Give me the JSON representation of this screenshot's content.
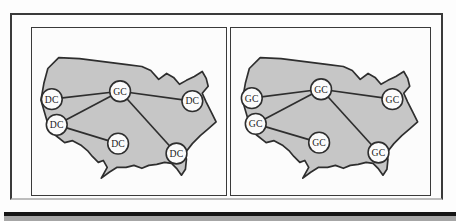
{
  "figure": {
    "node_radius": 10.5,
    "colors": {
      "background": "#fdfdfd",
      "map_fill": "#c6c6c6",
      "line": "#2e2e2e",
      "node_fill": "#fbfbfb",
      "node_text": "#1c1c1c",
      "bar_fill": "#a6a6a6",
      "bar_edge": "#161616"
    },
    "panels": [
      {
        "id": "left",
        "width": 196,
        "nodes": [
          {
            "label": "DC",
            "x": 20,
            "y": 72
          },
          {
            "label": "DC",
            "x": 25,
            "y": 98
          },
          {
            "label": "GC",
            "x": 89,
            "y": 64
          },
          {
            "label": "DC",
            "x": 162,
            "y": 74
          },
          {
            "label": "DC",
            "x": 87,
            "y": 117
          },
          {
            "label": "DC",
            "x": 146,
            "y": 127
          }
        ],
        "edges": [
          [
            2,
            0
          ],
          [
            2,
            1
          ],
          [
            2,
            3
          ],
          [
            2,
            5
          ],
          [
            1,
            4
          ]
        ]
      },
      {
        "id": "right",
        "width": 201,
        "nodes": [
          {
            "label": "GC",
            "x": 21,
            "y": 71
          },
          {
            "label": "GC",
            "x": 25,
            "y": 97
          },
          {
            "label": "GC",
            "x": 91,
            "y": 62
          },
          {
            "label": "GC",
            "x": 163,
            "y": 72
          },
          {
            "label": "GC",
            "x": 89,
            "y": 116
          },
          {
            "label": "GC",
            "x": 149,
            "y": 126
          }
        ],
        "edges": [
          [
            2,
            0
          ],
          [
            2,
            1
          ],
          [
            2,
            3
          ],
          [
            2,
            5
          ],
          [
            1,
            4
          ]
        ]
      }
    ]
  }
}
